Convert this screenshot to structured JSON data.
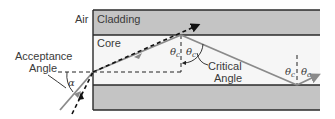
{
  "labels": {
    "air": "Air",
    "cladding": "Cladding",
    "core": "Core",
    "acceptance_line1": "Acceptance",
    "acceptance_line2": "Angle",
    "alpha": "α",
    "critical_line1": "Critical",
    "critical_line2": "Angle",
    "theta_c": "θ"
  },
  "colors": {
    "cladding": "#c4c4c4",
    "core": "#f6f6f6",
    "border": "#2a2a2a",
    "ray": "#8a8a8a",
    "dashed": "#111111"
  }
}
